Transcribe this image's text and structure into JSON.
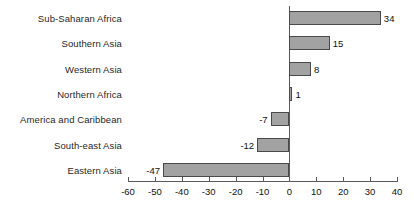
{
  "chart_data": {
    "type": "bar",
    "orientation": "horizontal",
    "title": "",
    "subtitle": "",
    "xlabel": "",
    "ylabel": "",
    "xlim": [
      -60,
      40
    ],
    "xticks": [
      -60,
      -50,
      -40,
      -30,
      -20,
      -10,
      0,
      10,
      20,
      30,
      40
    ],
    "xtick_labels": [
      "-60",
      "-50",
      "-40",
      "-30",
      "-20",
      "-10",
      "0",
      "10",
      "20",
      "30",
      "40"
    ],
    "grid": false,
    "legend": null,
    "legend_position": "none",
    "categories": [
      "Sub-Saharan Africa",
      "Southern Asia",
      "Western Asia",
      "Northern Africa",
      "America and Caribbean",
      "South-east Asia",
      "Eastern Asia"
    ],
    "values": [
      34,
      15,
      8,
      1,
      -7,
      -12,
      -47
    ],
    "data_labels": [
      "34",
      "15",
      "8",
      "1",
      "-7",
      "-12",
      "-47"
    ],
    "bar_fill_color": "#a2a2a2",
    "bar_edge_color": "#4a4a4a",
    "axis_color": "#5a5a5a",
    "text_color": "#111111"
  }
}
